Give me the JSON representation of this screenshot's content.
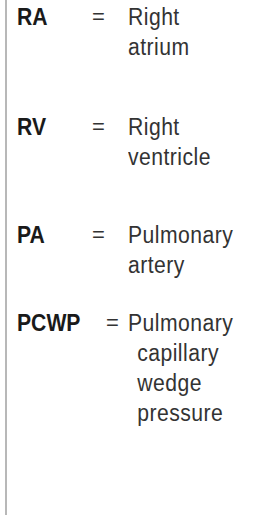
{
  "entries": [
    {
      "abbr": "RA",
      "eq": "=",
      "lines": [
        "Right",
        "atrium"
      ]
    },
    {
      "abbr": "RV",
      "eq": "=",
      "lines": [
        "Right",
        "ventricle"
      ]
    },
    {
      "abbr": "PA",
      "eq": "=",
      "lines": [
        "Pulmonary",
        "artery"
      ]
    },
    {
      "abbr": "PCWP",
      "eq": "=",
      "lines": [
        "Pulmonary",
        "capillary",
        "wedge",
        "pressure"
      ]
    }
  ]
}
